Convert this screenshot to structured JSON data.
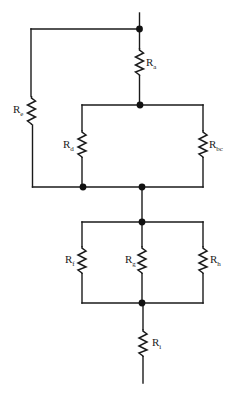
{
  "diagram": {
    "title": "",
    "type": "resistor network",
    "line_color": "#1a1a1a",
    "background": "#ffffff",
    "resistors": [
      {
        "id": "a",
        "label": "R",
        "subscript": "a"
      },
      {
        "id": "e",
        "label": "R",
        "subscript": "e"
      },
      {
        "id": "d",
        "label": "R",
        "subscript": "d"
      },
      {
        "id": "bc",
        "label": "R",
        "subscript": "bc"
      },
      {
        "id": "f",
        "label": "R",
        "subscript": "f"
      },
      {
        "id": "g",
        "label": "R",
        "subscript": "g"
      },
      {
        "id": "h",
        "label": "R",
        "subscript": "h"
      },
      {
        "id": "i",
        "label": "R",
        "subscript": "i"
      }
    ],
    "junctions": 7,
    "topology": [
      "Ra in series from top node to upper middle node",
      "Re from top node to bottom-left node (bypass loop)",
      "Rd and Rbc in parallel between upper middle node and lower bus",
      "Rf, Rg, Rh in parallel between lower bus and bottom node",
      "Ri in series from bottom node to terminal"
    ]
  }
}
